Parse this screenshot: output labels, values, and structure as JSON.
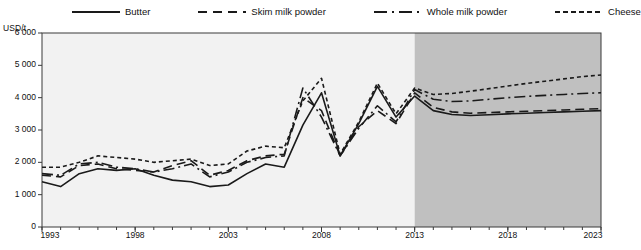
{
  "chart_data": {
    "type": "line",
    "title": "",
    "xlabel": "",
    "ylabel": "USD/t",
    "ylim": [
      0,
      6000
    ],
    "xlim": [
      1993,
      2023
    ],
    "ytick_labels": [
      "0",
      "1 000",
      "2 000",
      "3 000",
      "4 000",
      "5 000",
      "6 000"
    ],
    "ytick_values": [
      0,
      1000,
      2000,
      3000,
      4000,
      5000,
      6000
    ],
    "xtick_labels": [
      "1993",
      "1998",
      "2003",
      "2008",
      "2013",
      "2018",
      "2023"
    ],
    "xtick_values": [
      1993,
      1998,
      2003,
      2008,
      2013,
      2018,
      2023
    ],
    "minor_xticks_every": 1,
    "grid": false,
    "legend_position": "top",
    "projection_start": 2013,
    "projection_shading_color": "#c0c0c0",
    "history_background_color": "#f2f2f2",
    "line_color": "#1a1a1a",
    "x": [
      1993,
      1994,
      1995,
      1996,
      1997,
      1998,
      1999,
      2000,
      2001,
      2002,
      2003,
      2004,
      2005,
      2006,
      2007,
      2008,
      2009,
      2010,
      2011,
      2012,
      2013,
      2014,
      2015,
      2016,
      2017,
      2018,
      2019,
      2020,
      2021,
      2022,
      2023
    ],
    "series": [
      {
        "name": "Butter",
        "style": "solid",
        "values": [
          1400,
          1250,
          1650,
          1800,
          1750,
          1800,
          1600,
          1450,
          1400,
          1250,
          1300,
          1650,
          1950,
          1850,
          3150,
          4150,
          2200,
          3200,
          4350,
          3400,
          4050,
          3600,
          3480,
          3450,
          3470,
          3500,
          3520,
          3540,
          3560,
          3580,
          3600
        ]
      },
      {
        "name": "Skim milk powder",
        "style": "long-dash",
        "values": [
          1600,
          1550,
          1900,
          1950,
          1800,
          1750,
          1700,
          1900,
          2050,
          1600,
          1750,
          2050,
          2200,
          2250,
          4000,
          3600,
          2200,
          3100,
          3600,
          3200,
          4150,
          3700,
          3560,
          3520,
          3540,
          3560,
          3580,
          3600,
          3620,
          3640,
          3660
        ]
      },
      {
        "name": "Whole milk powder",
        "style": "dash-dot",
        "values": [
          1650,
          1600,
          1950,
          2000,
          1850,
          1800,
          1700,
          1800,
          1950,
          1550,
          1700,
          2000,
          2150,
          2200,
          4300,
          3400,
          2200,
          3050,
          3750,
          3250,
          4250,
          3950,
          3880,
          3900,
          3950,
          4000,
          4040,
          4070,
          4100,
          4130,
          4150
        ]
      },
      {
        "name": "Cheese",
        "style": "short-dash",
        "values": [
          1850,
          1850,
          2000,
          2200,
          2150,
          2100,
          2000,
          2050,
          2100,
          1900,
          1950,
          2350,
          2500,
          2450,
          3900,
          4600,
          2250,
          3250,
          4450,
          3500,
          4300,
          4100,
          4130,
          4200,
          4280,
          4360,
          4440,
          4510,
          4580,
          4650,
          4700
        ]
      }
    ]
  },
  "legend": {
    "items": [
      {
        "label": "Butter",
        "style": "solid"
      },
      {
        "label": "Skim milk powder",
        "style": "long-dash"
      },
      {
        "label": "Whole milk powder",
        "style": "dash-dot"
      },
      {
        "label": "Cheese",
        "style": "short-dash"
      }
    ]
  },
  "axis": {
    "y_unit": "USD/t"
  }
}
